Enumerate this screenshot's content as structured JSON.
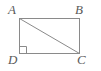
{
  "figure": {
    "name": "rectangle-with-diagonal",
    "background_color": "#ffffff",
    "stroke_color": "#8a8a8a",
    "label_color": "#5a5a5a",
    "stroke_width": 1,
    "labels": {
      "top_left": "A",
      "top_right": "B",
      "bottom_right": "C",
      "bottom_left": "D"
    },
    "geometry": {
      "rect_x": 19,
      "rect_y": 18,
      "rect_width": 61,
      "rect_height": 36,
      "diagonal": {
        "from": "A",
        "to": "C",
        "x1": 19,
        "y1": 18,
        "x2": 80,
        "y2": 54
      },
      "right_angle_marker": {
        "at_vertex": "D",
        "size": 7,
        "x": 19,
        "y": 47
      }
    }
  }
}
